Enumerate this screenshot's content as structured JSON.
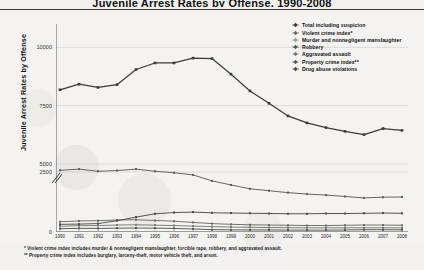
{
  "page": {
    "title": "Juvenile Arrest Rates by Offense, 1990-2008"
  },
  "chart_data": {
    "type": "line",
    "title": "Juvenile Arrest Rates by Offense, 1990-2008",
    "xlabel": "",
    "ylabel": "Juvenile Arrest Rates by Offense",
    "x": [
      1990,
      1991,
      1992,
      1993,
      1994,
      1995,
      1996,
      1997,
      1998,
      1999,
      2000,
      2001,
      2002,
      2003,
      2004,
      2005,
      2006,
      2007,
      2008
    ],
    "xtick_labels": [
      "1990",
      "1991",
      "1992",
      "1993",
      "1994",
      "1995",
      "1996",
      "1997",
      "1998",
      "1999",
      "2000",
      "2001",
      "2002",
      "2003",
      "2004",
      "2005",
      "2006",
      "2007",
      "2008"
    ],
    "ytick_labels": [
      "10000",
      "7500",
      "5000",
      "2500",
      "0"
    ],
    "ytick_values": [
      10000,
      7500,
      5000,
      2500,
      0
    ],
    "ylim": [
      0,
      11000
    ],
    "axis_break": true,
    "axis_break_between": [
      5000,
      2500
    ],
    "grid": true,
    "legend_position": "top-right",
    "series": [
      {
        "name": "Total including suspicion",
        "color": "#3b3b3b",
        "values": [
          8180,
          8420,
          8280,
          8400,
          9050,
          9330,
          9330,
          9540,
          9520,
          8850,
          8130,
          7600,
          7060,
          6760,
          6560,
          6400,
          6260,
          6520,
          6440
        ]
      },
      {
        "name": "Violent crime index*",
        "color": "#6a6a6a",
        "values": [
          430,
          460,
          470,
          500,
          510,
          480,
          450,
          400,
          350,
          320,
          300,
          290,
          280,
          270,
          270,
          280,
          290,
          290,
          280
        ]
      },
      {
        "name": "Murder and nonnegligent manslaughter",
        "color": "#9a9a9a",
        "values": [
          12,
          13,
          14,
          15,
          14,
          12,
          10,
          8,
          6,
          5,
          5,
          4,
          4,
          4,
          4,
          5,
          5,
          5,
          5
        ]
      },
      {
        "name": "Robbery",
        "color": "#555555",
        "values": [
          140,
          150,
          150,
          160,
          165,
          160,
          150,
          125,
          100,
          90,
          85,
          85,
          80,
          78,
          78,
          85,
          95,
          95,
          90
        ]
      },
      {
        "name": "Aggravated assault",
        "color": "#777777",
        "values": [
          240,
          260,
          270,
          290,
          300,
          285,
          270,
          245,
          225,
          205,
          195,
          185,
          180,
          175,
          175,
          175,
          175,
          175,
          170
        ]
      },
      {
        "name": "Property crime index**",
        "color": "#5c5c5c",
        "values": [
          2570,
          2620,
          2530,
          2560,
          2620,
          2530,
          2470,
          2380,
          2130,
          1960,
          1800,
          1720,
          1640,
          1580,
          1540,
          1480,
          1420,
          1450,
          1460
        ]
      },
      {
        "name": "Drug abuse violations",
        "color": "#4a4a4a",
        "values": [
          320,
          330,
          350,
          470,
          620,
          760,
          810,
          830,
          800,
          790,
          780,
          770,
          760,
          760,
          770,
          770,
          780,
          790,
          780
        ]
      }
    ]
  },
  "legend": {
    "items": [
      "Total including suspicion",
      "Violent crime index*",
      "Murder and nonnegligent manslaughter",
      "Robbery",
      "Aggravated assault",
      "Property crime index**",
      "Drug abuse violations"
    ]
  },
  "footnotes": [
    "* Violent crime index includes murder & nonnegligent manslaughter, forcible rape, robbery, and aggravated assault.",
    "** Property crime index includes burglary, larceny-theft, motor vehicle theft, and arson."
  ]
}
